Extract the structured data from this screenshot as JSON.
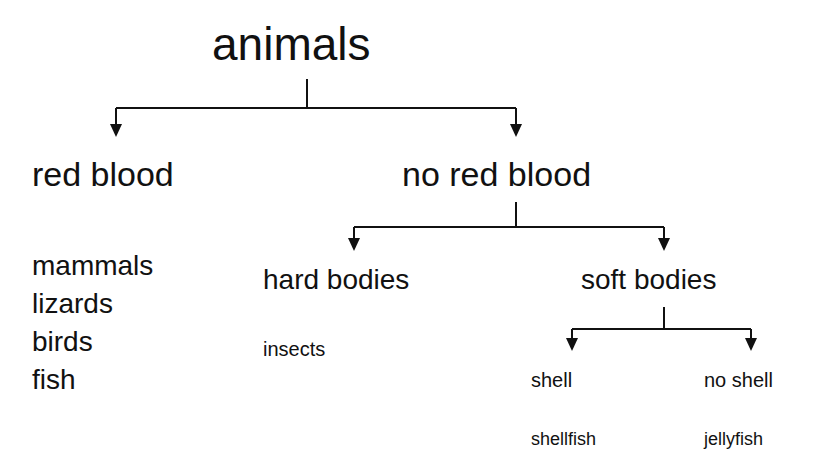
{
  "diagram": {
    "type": "classification-tree",
    "root": "animals",
    "level1": {
      "left": {
        "label": "red blood",
        "examples": [
          "mammals",
          "lizards",
          "birds",
          "fish"
        ]
      },
      "right": {
        "label": "no red blood"
      }
    },
    "level2": {
      "left": {
        "label": "hard bodies",
        "example": "insects"
      },
      "right": {
        "label": "soft bodies"
      }
    },
    "level3": {
      "left": {
        "label": "shell",
        "example": "shellfish"
      },
      "right": {
        "label": "no shell",
        "example": "jellyfish"
      }
    },
    "line_color": "#111111"
  }
}
